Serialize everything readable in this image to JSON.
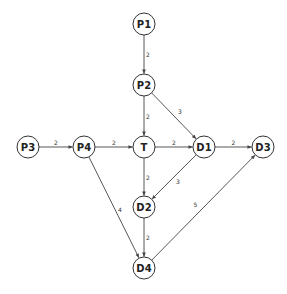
{
  "diagram": {
    "type": "directed-weighted-graph",
    "node_radius": 11,
    "nodes": [
      {
        "id": "P1",
        "label": "P1",
        "x": 144,
        "y": 24
      },
      {
        "id": "P2",
        "label": "P2",
        "x": 144,
        "y": 85
      },
      {
        "id": "P3",
        "label": "P3",
        "x": 28,
        "y": 147
      },
      {
        "id": "P4",
        "label": "P4",
        "x": 84,
        "y": 147
      },
      {
        "id": "T",
        "label": "T",
        "x": 144,
        "y": 147
      },
      {
        "id": "D1",
        "label": "D1",
        "x": 204,
        "y": 147
      },
      {
        "id": "D3",
        "label": "D3",
        "x": 263,
        "y": 147
      },
      {
        "id": "D2",
        "label": "D2",
        "x": 144,
        "y": 207
      },
      {
        "id": "D4",
        "label": "D4",
        "x": 144,
        "y": 268
      }
    ],
    "edges": [
      {
        "from": "P1",
        "to": "P2",
        "weight": "2",
        "label_dx": 4,
        "label_dy": 0
      },
      {
        "from": "P2",
        "to": "T",
        "weight": "2",
        "label_dx": 4,
        "label_dy": 0
      },
      {
        "from": "P2",
        "to": "D1",
        "weight": "3",
        "label_dx": 6,
        "label_dy": -5
      },
      {
        "from": "P3",
        "to": "P4",
        "weight": "2",
        "label_dx": 0,
        "label_dy": -5
      },
      {
        "from": "P4",
        "to": "T",
        "weight": "2",
        "label_dx": 0,
        "label_dy": -5
      },
      {
        "from": "T",
        "to": "D1",
        "weight": "2",
        "label_dx": 0,
        "label_dy": -5
      },
      {
        "from": "D1",
        "to": "D3",
        "weight": "2",
        "label_dx": 0,
        "label_dy": -5
      },
      {
        "from": "T",
        "to": "D2",
        "weight": "2",
        "label_dx": 4,
        "label_dy": 0
      },
      {
        "from": "D1",
        "to": "D2",
        "weight": "3",
        "label_dx": 4,
        "label_dy": 4
      },
      {
        "from": "P4",
        "to": "D4",
        "weight": "4",
        "label_dx": 6,
        "label_dy": 2
      },
      {
        "from": "D2",
        "to": "D4",
        "weight": "2",
        "label_dx": 4,
        "label_dy": 0
      },
      {
        "from": "D4",
        "to": "D3",
        "weight": "5",
        "label_dx": -8,
        "label_dy": -3
      }
    ]
  },
  "colors": {
    "background": "#ffffff",
    "stroke": "#333333",
    "text": "#222222"
  }
}
